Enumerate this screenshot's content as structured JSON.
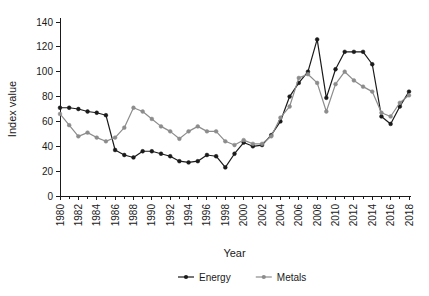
{
  "chart_data": {
    "type": "line",
    "title": "",
    "xlabel": "Year",
    "ylabel": "Index value",
    "ylim": [
      0,
      140
    ],
    "ytick_step": 20,
    "yticks": [
      0,
      20,
      40,
      60,
      80,
      100,
      120,
      140
    ],
    "xlim": [
      1980,
      2018
    ],
    "x": [
      1980,
      1981,
      1982,
      1983,
      1984,
      1985,
      1986,
      1987,
      1988,
      1989,
      1990,
      1991,
      1992,
      1993,
      1994,
      1995,
      1996,
      1997,
      1998,
      1999,
      2000,
      2001,
      2002,
      2003,
      2004,
      2005,
      2006,
      2007,
      2008,
      2009,
      2010,
      2011,
      2012,
      2013,
      2014,
      2015,
      2016,
      2017,
      2018
    ],
    "xtick_labels": [
      "1980",
      "1982",
      "1984",
      "1986",
      "1988",
      "1990",
      "1992",
      "1994",
      "1996",
      "1998",
      "2000",
      "2002",
      "2004",
      "2006",
      "2008",
      "2010",
      "2012",
      "2014",
      "2016",
      "2018"
    ],
    "xtick_label_step": 2,
    "minor_ticks_every_year": true,
    "grid": false,
    "legend_position": "bottom",
    "series": [
      {
        "name": "Energy",
        "color": "#1a1a1a",
        "marker": "circle",
        "values": [
          71,
          71,
          70,
          68,
          67,
          65,
          37,
          33,
          31,
          36,
          36,
          34,
          32,
          28,
          27,
          28,
          33,
          32,
          23,
          34,
          43,
          40,
          41,
          49,
          60,
          80,
          91,
          100,
          126,
          79,
          102,
          116,
          116,
          116,
          106,
          64,
          58,
          72,
          84
        ]
      },
      {
        "name": "Metals",
        "color": "#8c8c8c",
        "marker": "circle",
        "values": [
          66,
          57,
          48,
          51,
          47,
          44,
          47,
          55,
          71,
          68,
          62,
          56,
          52,
          46,
          52,
          56,
          52,
          52,
          44,
          41,
          45,
          42,
          42,
          48,
          63,
          72,
          95,
          98,
          91,
          68,
          90,
          100,
          93,
          88,
          84,
          67,
          64,
          75,
          81
        ]
      }
    ]
  },
  "legend": {
    "items": [
      {
        "label": "Energy",
        "color": "#1a1a1a"
      },
      {
        "label": "Metals",
        "color": "#8c8c8c"
      }
    ]
  }
}
